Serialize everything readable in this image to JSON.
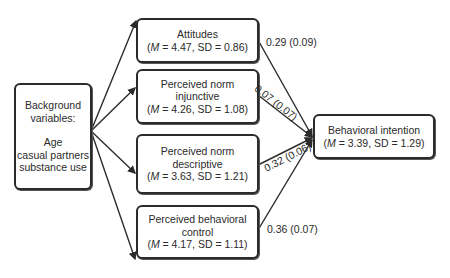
{
  "diagram": {
    "type": "path-model",
    "nodes": {
      "background": {
        "title_line1": "Background",
        "title_line2": "variables:",
        "items": [
          "Age",
          "casual partners",
          "substance use"
        ]
      },
      "attitudes": {
        "label": "Attitudes",
        "M": "4.47",
        "SD": "0.86"
      },
      "norm_injunctive": {
        "label_line1": "Perceived norm",
        "label_line2": "injunctive",
        "M": "4.26",
        "SD": "1.08"
      },
      "norm_descriptive": {
        "label_line1": "Perceived norm",
        "label_line2": "descriptive",
        "M": "3.63",
        "SD": "1.21"
      },
      "pbc": {
        "label_line1": "Perceived behavioral",
        "label_line2": "control",
        "M": "4.17",
        "SD": "1.11"
      },
      "intention": {
        "label": "Behavioral intention",
        "M": "3.39",
        "SD": "1.29"
      }
    },
    "paths": [
      {
        "from": "attitudes",
        "to": "intention",
        "label": "0.29 (0.09)"
      },
      {
        "from": "norm_injunctive",
        "to": "intention",
        "label": "0.07 (0.07)"
      },
      {
        "from": "norm_descriptive",
        "to": "intention",
        "label": "0.32 (0.06)"
      },
      {
        "from": "pbc",
        "to": "intention",
        "label": "0.36 (0.07)"
      }
    ],
    "stat_text": {
      "m_symbol": "M",
      "sd_prefix": "SD"
    }
  }
}
